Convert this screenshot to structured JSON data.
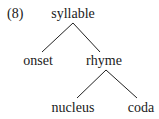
{
  "example_number": "(8)",
  "tree": {
    "root": {
      "label": "syllable",
      "x": 73,
      "y": 6
    },
    "nodes": [
      {
        "id": "onset",
        "label": "onset",
        "x": 38,
        "y": 53
      },
      {
        "id": "rhyme",
        "label": "rhyme",
        "x": 104,
        "y": 53
      },
      {
        "id": "nucleus",
        "label": "nucleus",
        "x": 73,
        "y": 100
      },
      {
        "id": "coda",
        "label": "coda",
        "x": 141,
        "y": 100
      }
    ],
    "edges": [
      {
        "from": "syllable",
        "to": "onset"
      },
      {
        "from": "syllable",
        "to": "rhyme"
      },
      {
        "from": "rhyme",
        "to": "nucleus"
      },
      {
        "from": "rhyme",
        "to": "coda"
      }
    ]
  }
}
